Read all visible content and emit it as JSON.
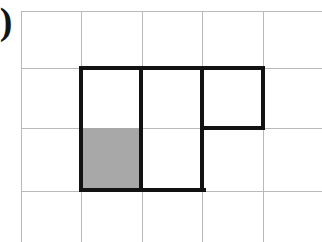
{
  "figure": {
    "label": ")",
    "type": "polyomino-on-grid",
    "colors": {
      "background": "#ffffff",
      "grid_line": "#b9b9b9",
      "bold_outline": "#121212",
      "shaded_fill": "#a8a8a8"
    },
    "grid": {
      "cell_width": 60.5,
      "cell_height": 60,
      "columns": 5,
      "rows": 4,
      "vertical_line_x": [
        21,
        81,
        142,
        202,
        263
      ],
      "horizontal_line_y": [
        11,
        68,
        128,
        191
      ]
    },
    "shape": {
      "name": "P-pentomino",
      "cell_count": 5,
      "cells": [
        {
          "row": 1,
          "col": 1,
          "shaded": false
        },
        {
          "row": 1,
          "col": 2,
          "shaded": false
        },
        {
          "row": 1,
          "col": 3,
          "shaded": false
        },
        {
          "row": 2,
          "col": 1,
          "shaded": true
        },
        {
          "row": 2,
          "col": 2,
          "shaded": false
        }
      ],
      "shaded_cell_count": 1
    },
    "bold_outline_segments": {
      "horizontal": [
        {
          "x": 79,
          "y": 66,
          "width": 186
        },
        {
          "x": 200,
          "y": 126,
          "width": 65
        },
        {
          "x": 79,
          "y": 188,
          "width": 127
        }
      ],
      "vertical": [
        {
          "x": 79,
          "y": 66,
          "height": 126
        },
        {
          "x": 139,
          "y": 66,
          "height": 126
        },
        {
          "x": 200,
          "y": 66,
          "height": 126
        },
        {
          "x": 261,
          "y": 66,
          "height": 64
        }
      ]
    },
    "shaded_rect": {
      "x": 81,
      "y": 128,
      "width": 60,
      "height": 62
    }
  }
}
